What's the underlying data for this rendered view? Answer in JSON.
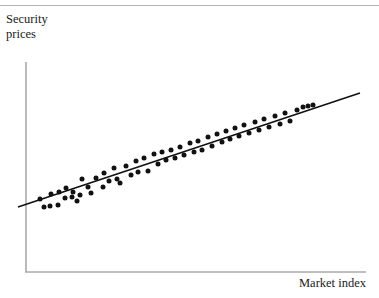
{
  "figure": {
    "background_color": "#ffffff",
    "axis_color": "#a8a8a8",
    "point_color": "#111111",
    "line_color": "#111111",
    "top_rule_color": "#b4b4b4"
  },
  "labels": {
    "y_axis": "Security\nprices",
    "x_axis": "Market index"
  },
  "chart_data": {
    "type": "scatter",
    "title": "",
    "xlabel": "Market index",
    "ylabel": "Security prices",
    "xlim": [
      0,
      100
    ],
    "ylim": [
      0,
      100
    ],
    "grid": false,
    "legend": null,
    "axes": {
      "y_axis_x_px": 26,
      "y_axis_top_px": 62,
      "y_axis_bottom_px": 272,
      "x_axis_y_px": 272,
      "x_axis_left_px": 26,
      "x_axis_right_px": 366,
      "ticks_shown": false,
      "tick_labels": []
    },
    "trendline": {
      "name": "characteristic line",
      "type": "linear-fit",
      "x": [
        -2.4,
        100.7
      ],
      "y": [
        31.0,
        85.2
      ],
      "px_start": [
        18,
        207
      ],
      "px_end": [
        360,
        93
      ]
    },
    "series": [
      {
        "name": "securities",
        "marker": "filled-circle",
        "marker_size_px": 5,
        "n_points": 62,
        "x": [
          4.2,
          5.5,
          7.4,
          7.7,
          9.7,
          10.0,
          11.9,
          12.2,
          14.1,
          14.4,
          15.6,
          16.5,
          17.0,
          18.8,
          19.7,
          21.2,
          23.2,
          23.5,
          25.0,
          26.5,
          27.4,
          28.2,
          30.0,
          31.5,
          32.9,
          33.5,
          35.3,
          36.5,
          38.2,
          39.4,
          40.6,
          41.8,
          43.2,
          44.4,
          45.9,
          47.1,
          48.8,
          50.0,
          51.2,
          52.4,
          54.1,
          55.3,
          56.8,
          58.2,
          59.4,
          60.6,
          62.1,
          63.2,
          64.7,
          66.2,
          67.9,
          69.1,
          70.6,
          72.1,
          73.8,
          75.3,
          76.8,
          78.2,
          80.3,
          82.1,
          83.5,
          85.0
        ],
        "y": [
          35.2,
          31.3,
          31.8,
          37.6,
          32.3,
          38.5,
          35.7,
          40.4,
          36.2,
          42.4,
          33.3,
          38.0,
          45.7,
          41.9,
          39.0,
          46.2,
          40.9,
          47.6,
          43.8,
          50.0,
          44.8,
          42.9,
          51.0,
          46.7,
          53.3,
          48.1,
          55.2,
          49.5,
          57.1,
          52.4,
          58.1,
          54.3,
          59.0,
          55.2,
          60.5,
          57.1,
          62.4,
          58.6,
          63.3,
          59.5,
          65.2,
          61.0,
          66.7,
          62.9,
          68.1,
          64.8,
          69.5,
          66.2,
          71.0,
          67.6,
          72.4,
          69.0,
          73.8,
          70.5,
          75.2,
          71.9,
          76.7,
          73.3,
          78.1,
          79.0,
          79.5,
          80.0
        ],
        "points_px": [
          [
            40,
            199
          ],
          [
            44,
            207
          ],
          [
            50,
            206
          ],
          [
            51,
            194
          ],
          [
            58,
            205
          ],
          [
            59,
            192
          ],
          [
            65,
            198
          ],
          [
            66,
            188
          ],
          [
            72,
            197
          ],
          [
            73,
            192
          ],
          [
            77,
            201
          ],
          [
            80,
            195
          ],
          [
            82,
            179
          ],
          [
            88,
            187
          ],
          [
            91,
            193
          ],
          [
            96,
            178
          ],
          [
            103,
            187
          ],
          [
            104,
            173
          ],
          [
            109,
            181
          ],
          [
            114,
            168
          ],
          [
            117,
            179
          ],
          [
            120,
            183
          ],
          [
            126,
            166
          ],
          [
            131,
            175
          ],
          [
            136,
            161
          ],
          [
            138,
            172
          ],
          [
            144,
            158
          ],
          [
            148,
            171
          ],
          [
            154,
            154
          ],
          [
            158,
            164
          ],
          [
            162,
            152
          ],
          [
            166,
            160
          ],
          [
            171,
            150
          ],
          [
            175,
            158
          ],
          [
            180,
            147
          ],
          [
            184,
            155
          ],
          [
            190,
            143
          ],
          [
            194,
            152
          ],
          [
            198,
            141
          ],
          [
            202,
            150
          ],
          [
            208,
            137
          ],
          [
            212,
            146
          ],
          [
            217,
            134
          ],
          [
            222,
            142
          ],
          [
            226,
            131
          ],
          [
            230,
            139
          ],
          [
            235,
            128
          ],
          [
            239,
            136
          ],
          [
            244,
            125
          ],
          [
            249,
            133
          ],
          [
            255,
            122
          ],
          [
            259,
            130
          ],
          [
            264,
            119
          ],
          [
            269,
            127
          ],
          [
            275,
            116
          ],
          [
            280,
            124
          ],
          [
            285,
            113
          ],
          [
            290,
            121
          ],
          [
            297,
            110
          ],
          [
            303,
            107
          ],
          [
            308,
            106
          ],
          [
            313,
            105
          ]
        ]
      }
    ]
  }
}
